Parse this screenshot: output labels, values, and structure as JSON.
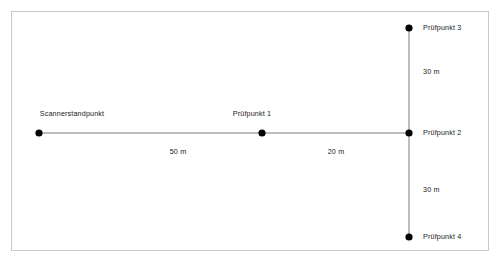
{
  "diagram": {
    "type": "survey-setup-schematic",
    "frame": {
      "border_color": "#c8c8c8",
      "background": "#ffffff"
    },
    "line_color": "#7a7a7a",
    "point_color": "#000000",
    "points": [
      {
        "id": "scanner",
        "label": "Scannerstandpunkt",
        "x": 39,
        "y": 133,
        "label_position": "above"
      },
      {
        "id": "pruefpunkt1",
        "label": "Prüfpunkt 1",
        "x": 262,
        "y": 133,
        "label_position": "above"
      },
      {
        "id": "pruefpunkt2",
        "label": "Prüfpunkt 2",
        "x": 409,
        "y": 133,
        "label_position": "right"
      },
      {
        "id": "pruefpunkt3",
        "label": "Prüfpunkt 3",
        "x": 409,
        "y": 28,
        "label_position": "right"
      },
      {
        "id": "pruefpunkt4",
        "label": "Prüfpunkt 4",
        "x": 409,
        "y": 237,
        "label_position": "right"
      }
    ],
    "segments": [
      {
        "id": "scanner-to-p1",
        "from": "scanner",
        "to": "pruefpunkt1",
        "orientation": "horizontal",
        "distance": "50 m",
        "label_x": 178,
        "label_y": 152
      },
      {
        "id": "p1-to-p2",
        "from": "pruefpunkt1",
        "to": "pruefpunkt2",
        "orientation": "horizontal",
        "distance": "20 m",
        "label_x": 336,
        "label_y": 152
      },
      {
        "id": "p3-to-p2",
        "from": "pruefpunkt3",
        "to": "pruefpunkt2",
        "orientation": "vertical",
        "distance": "30 m",
        "label_x": 423,
        "label_y": 72
      },
      {
        "id": "p2-to-p4",
        "from": "pruefpunkt2",
        "to": "pruefpunkt4",
        "orientation": "vertical",
        "distance": "30 m",
        "label_x": 423,
        "label_y": 190
      }
    ]
  }
}
